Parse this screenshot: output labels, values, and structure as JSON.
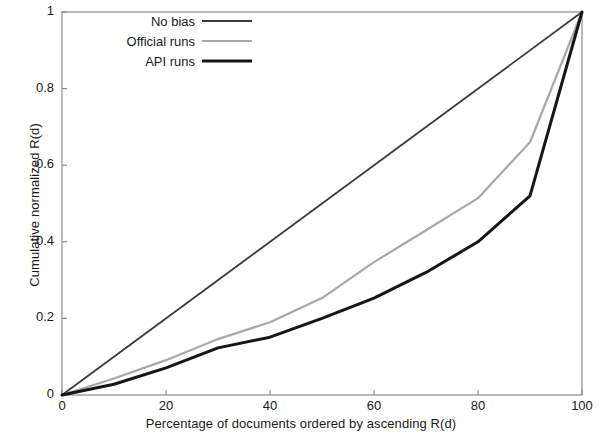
{
  "chart_data": {
    "type": "line",
    "title": "",
    "xlabel": "Percentage of documents ordered by ascending R(d)",
    "ylabel": "Cumulative normalized R(d)",
    "xlim": [
      0,
      100
    ],
    "ylim": [
      0,
      1
    ],
    "xticks": [
      "0",
      "20",
      "40",
      "60",
      "80",
      "100"
    ],
    "yticks": [
      "0",
      "0.2",
      "0.4",
      "0.6",
      "0.8",
      "1"
    ],
    "xtick_values": [
      0,
      20,
      40,
      60,
      80,
      100
    ],
    "ytick_values": [
      0,
      0.2,
      0.4,
      0.6,
      0.8,
      1
    ],
    "grid": false,
    "legend_position": "top-left",
    "series": [
      {
        "name": "No bias",
        "color": "#3a3a3a",
        "width": 1.8,
        "x": [
          0,
          100
        ],
        "values": [
          0,
          1
        ]
      },
      {
        "name": "Official runs",
        "color": "#a8a8a8",
        "width": 2.2,
        "x": [
          0,
          10,
          20,
          30,
          40,
          50,
          60,
          70,
          80,
          90,
          100
        ],
        "values": [
          0,
          0.043,
          0.091,
          0.146,
          0.19,
          0.253,
          0.347,
          0.43,
          0.514,
          0.66,
          1
        ]
      },
      {
        "name": "API runs",
        "color": "#161616",
        "width": 3.0,
        "x": [
          0,
          10,
          20,
          30,
          40,
          50,
          60,
          70,
          80,
          90,
          100
        ],
        "values": [
          0,
          0.028,
          0.071,
          0.123,
          0.151,
          0.2,
          0.253,
          0.32,
          0.4,
          0.52,
          1
        ]
      }
    ]
  },
  "legend": {
    "items": [
      {
        "label": "No bias"
      },
      {
        "label": "Official runs"
      },
      {
        "label": "API runs"
      }
    ]
  },
  "axes": {
    "frame_color": "#8a8a8a"
  }
}
